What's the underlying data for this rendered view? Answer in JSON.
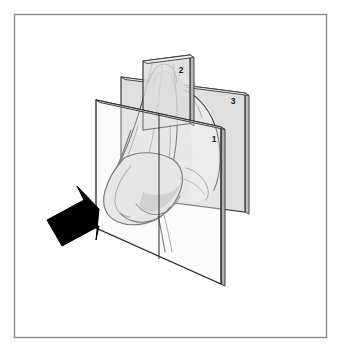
{
  "figure": {
    "caption": "",
    "border_color": "#8c8c8c",
    "background_color": "#ffffff",
    "outline_color": "#2b2b2b",
    "arrow_color": "#000000",
    "plane_fill": "#d8d8d8",
    "plane_edge": "#3a3a3a"
  },
  "planes": [
    {
      "id": "plane-1",
      "label": "1",
      "name": "anterior-section-plane",
      "description": "Front-most sagittal section plane through the nasal tip",
      "label_x": 214,
      "label_y": 142,
      "fill": "#e6e6e6",
      "opacity": 0.42
    },
    {
      "id": "plane-2",
      "label": "2",
      "name": "upper-section-plane",
      "description": "Small superior section plane across the nasal dorsum",
      "label_x": 181,
      "label_y": 73,
      "fill": "#dcdcdc",
      "opacity": 0.62
    },
    {
      "id": "plane-3",
      "label": "3",
      "name": "posterior-section-plane",
      "description": "Posterior section plane spanning the mid-face",
      "label_x": 233,
      "label_y": 104,
      "fill": "#d6d6d6",
      "opacity": 0.58
    }
  ],
  "arrow": {
    "name": "view-direction-arrow",
    "label": "",
    "direction": "up-right",
    "tip_x": 99,
    "tip_y": 209
  },
  "anatomy": {
    "name": "nose-illustration",
    "parts": [
      "nasal-dorsum",
      "upper-lateral-cartilage",
      "lower-lateral-cartilage",
      "nasal-tip",
      "ala",
      "columella",
      "cheek-contour"
    ]
  }
}
